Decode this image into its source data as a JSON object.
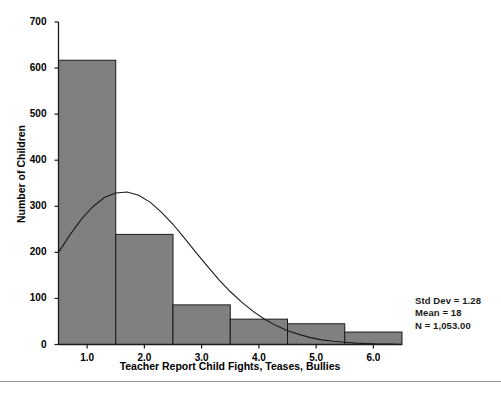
{
  "chart_data": {
    "type": "bar",
    "title": "",
    "xlabel": "Teacher Report Child Fights, Teases, Bullies",
    "ylabel": "Number of Children",
    "categories": [
      "1.0",
      "2.0",
      "3.0",
      "4.0",
      "5.0",
      "6.0"
    ],
    "values": [
      617,
      239,
      86,
      55,
      45,
      27
    ],
    "bin_edges": [
      0.5,
      1.5,
      2.5,
      3.5,
      4.5,
      5.5,
      6.5
    ],
    "xlim": [
      0.5,
      6.5
    ],
    "ylim": [
      0,
      700
    ],
    "ytick_labels": [
      "0",
      "100",
      "200",
      "300",
      "400",
      "500",
      "600",
      "700"
    ],
    "ytick_values": [
      0,
      100,
      200,
      300,
      400,
      500,
      600,
      700
    ],
    "xtick_labels": [
      "1.0",
      "2.0",
      "3.0",
      "4.0",
      "5.0",
      "6.0"
    ],
    "xtick_values": [
      1.0,
      2.0,
      3.0,
      4.0,
      5.0,
      6.0
    ],
    "grid": false,
    "legend": false,
    "bar_color": "#808080",
    "bar_edge_color": "#1a1a1a",
    "overlay": {
      "type": "normal-curve",
      "color": "#1a1a1a",
      "points": [
        [
          0.5,
          200
        ],
        [
          0.7,
          238
        ],
        [
          0.9,
          272
        ],
        [
          1.1,
          299
        ],
        [
          1.3,
          319
        ],
        [
          1.5,
          329
        ],
        [
          1.7,
          331
        ],
        [
          1.9,
          324
        ],
        [
          2.1,
          309
        ],
        [
          2.3,
          287
        ],
        [
          2.5,
          261
        ],
        [
          2.7,
          231
        ],
        [
          2.9,
          200
        ],
        [
          3.1,
          170
        ],
        [
          3.3,
          141
        ],
        [
          3.5,
          115
        ],
        [
          3.7,
          92
        ],
        [
          3.9,
          72
        ],
        [
          4.1,
          55
        ],
        [
          4.3,
          41
        ],
        [
          4.5,
          30
        ],
        [
          4.7,
          22
        ],
        [
          4.9,
          15
        ],
        [
          5.1,
          10
        ],
        [
          5.3,
          7
        ],
        [
          5.5,
          5
        ],
        [
          5.7,
          3
        ],
        [
          5.9,
          2
        ],
        [
          6.1,
          1
        ],
        [
          6.3,
          1
        ],
        [
          6.5,
          0
        ]
      ]
    },
    "annotations": {
      "std_dev": "Std Dev = 1.28",
      "mean": "Mean = 18",
      "n": "N = 1,053.00"
    }
  }
}
